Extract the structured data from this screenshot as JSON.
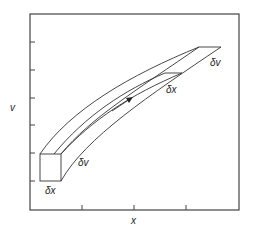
{
  "diagram": {
    "title": "",
    "axes": {
      "x_label": "x",
      "y_label": "v",
      "x_ticks": 3,
      "y_ticks": 6
    },
    "labels": {
      "box_bottom": "δx",
      "box_side": "δv",
      "mid_step": "δx",
      "end_side": "δv"
    },
    "elements": [
      "frame",
      "phase-space-tube",
      "initial-volume-box",
      "flow-direction-arrow"
    ],
    "colors": {
      "stroke": "#333333",
      "background": "#ffffff"
    }
  }
}
